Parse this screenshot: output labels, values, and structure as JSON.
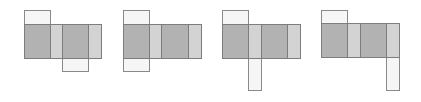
{
  "colors": {
    "dark_face": "#b2b2b2",
    "light_face": "#d3d3d3",
    "flap_face": "#f6f6f6",
    "border": "#7d7d7d"
  },
  "figures": [
    {
      "id": "net-1",
      "strip": {
        "x": 24,
        "y": 24,
        "h": 34
      },
      "segments": [
        {
          "x": 24,
          "w": 26,
          "tone": "dark"
        },
        {
          "x": 50,
          "w": 12,
          "tone": "light"
        },
        {
          "x": 62,
          "w": 26,
          "tone": "dark"
        },
        {
          "x": 88,
          "w": 13,
          "tone": "light"
        }
      ],
      "flaps": [
        {
          "position": "top",
          "x": 24,
          "y": 10,
          "w": 26,
          "h": 14
        },
        {
          "position": "bottom",
          "x": 62,
          "y": 58,
          "w": 26,
          "h": 13
        }
      ]
    },
    {
      "id": "net-2",
      "strip": {
        "x": 123,
        "y": 24,
        "h": 34
      },
      "segments": [
        {
          "x": 123,
          "w": 26,
          "tone": "dark"
        },
        {
          "x": 149,
          "w": 12,
          "tone": "light"
        },
        {
          "x": 161,
          "w": 27,
          "tone": "dark"
        },
        {
          "x": 188,
          "w": 13,
          "tone": "light"
        }
      ],
      "flaps": [
        {
          "position": "top",
          "x": 123,
          "y": 10,
          "w": 26,
          "h": 14
        },
        {
          "position": "bottom",
          "x": 123,
          "y": 58,
          "w": 26,
          "h": 13
        }
      ]
    },
    {
      "id": "net-3",
      "strip": {
        "x": 222,
        "y": 24,
        "h": 34
      },
      "segments": [
        {
          "x": 222,
          "w": 26,
          "tone": "dark"
        },
        {
          "x": 248,
          "w": 13,
          "tone": "light"
        },
        {
          "x": 261,
          "w": 26,
          "tone": "dark"
        },
        {
          "x": 287,
          "w": 13,
          "tone": "light"
        }
      ],
      "flaps": [
        {
          "position": "top",
          "x": 222,
          "y": 10,
          "w": 26,
          "h": 14
        },
        {
          "position": "bottom",
          "x": 248,
          "y": 58,
          "w": 13,
          "h": 32
        }
      ]
    },
    {
      "id": "net-4",
      "strip": {
        "x": 321,
        "y": 23,
        "h": 34
      },
      "segments": [
        {
          "x": 321,
          "w": 26,
          "tone": "dark"
        },
        {
          "x": 347,
          "w": 13,
          "tone": "light"
        },
        {
          "x": 360,
          "w": 26,
          "tone": "dark"
        },
        {
          "x": 386,
          "w": 13,
          "tone": "light"
        }
      ],
      "flaps": [
        {
          "position": "top",
          "x": 321,
          "y": 10,
          "w": 26,
          "h": 13
        },
        {
          "position": "bottom",
          "x": 386,
          "y": 57,
          "w": 13,
          "h": 33
        }
      ]
    }
  ]
}
